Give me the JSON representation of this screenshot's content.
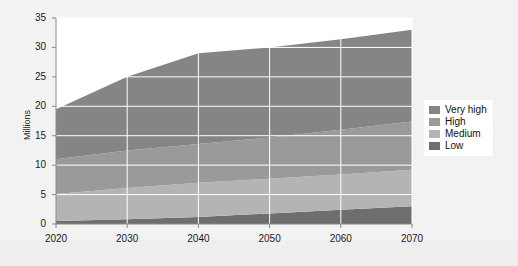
{
  "chart_data": {
    "type": "area",
    "stacked": true,
    "title": "",
    "xlabel": "",
    "ylabel": "Millions",
    "x": [
      2020,
      2030,
      2040,
      2050,
      2060,
      2070
    ],
    "xlim": [
      2020,
      2070
    ],
    "ylim": [
      0,
      35
    ],
    "yticks": [
      0,
      5,
      10,
      15,
      20,
      25,
      30,
      35
    ],
    "xticks": [
      2020,
      2030,
      2040,
      2050,
      2060,
      2070
    ],
    "ytick_labels": [
      "0",
      "5",
      "10",
      "15",
      "20",
      "25",
      "30",
      "35"
    ],
    "xtick_labels": [
      "2020",
      "2030",
      "2040",
      "2050",
      "2060",
      "2070"
    ],
    "grid": true,
    "legend_position": "right",
    "series": [
      {
        "name": "Low",
        "color": "#6e6e6e",
        "values": [
          0.5,
          0.8,
          1.2,
          1.8,
          2.4,
          3.0
        ]
      },
      {
        "name": "Medium",
        "color": "#b4b4b4",
        "values": [
          4.6,
          5.3,
          5.8,
          5.9,
          6.0,
          6.2
        ]
      },
      {
        "name": "High",
        "color": "#9a9a9a",
        "values": [
          5.9,
          6.4,
          6.6,
          7.0,
          7.6,
          8.2
        ]
      },
      {
        "name": "Very high",
        "color": "#858585",
        "values": [
          8.5,
          12.5,
          15.4,
          15.3,
          15.4,
          15.6
        ]
      }
    ],
    "totals": [
      19.5,
      25.0,
      29.0,
      30.0,
      31.4,
      33.0
    ],
    "stack_order_bottom_to_top": [
      "Low",
      "Medium",
      "High",
      "Very high"
    ]
  },
  "legend": {
    "items": [
      {
        "label": "Very high",
        "color": "#858585"
      },
      {
        "label": "High",
        "color": "#9a9a9a"
      },
      {
        "label": "Medium",
        "color": "#b4b4b4"
      },
      {
        "label": "Low",
        "color": "#6e6e6e"
      }
    ]
  },
  "colors": {
    "background": "#eeeeee",
    "card": "#f2f2f2",
    "plot_background": "#ffffff",
    "grid": "#ffffff",
    "axis": "#8a8a8a",
    "text": "#1a1a1a"
  }
}
